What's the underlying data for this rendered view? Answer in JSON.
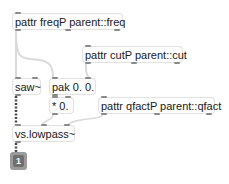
{
  "patcher": {
    "objects": [
      {
        "id": "pattr-freq",
        "text": "pattr freqP parent::freq"
      },
      {
        "id": "pattr-cut",
        "text": "pattr cutP parent::cut"
      },
      {
        "id": "saw",
        "text": "saw~"
      },
      {
        "id": "pak",
        "text": "pak 0. 0."
      },
      {
        "id": "mul",
        "text": "* 0."
      },
      {
        "id": "pattr-qfact",
        "text": "pattr qfactP parent::qfact"
      },
      {
        "id": "lowpass",
        "text": "vs.lowpass~"
      }
    ],
    "outlet_box": {
      "label": "1"
    }
  },
  "colors": {
    "background": "#ffffff",
    "box_border": "#e2e2e2",
    "control_cord": "#d8d8d8",
    "signal_cord": "#4a4a4a",
    "port": "#8a8a8a"
  }
}
